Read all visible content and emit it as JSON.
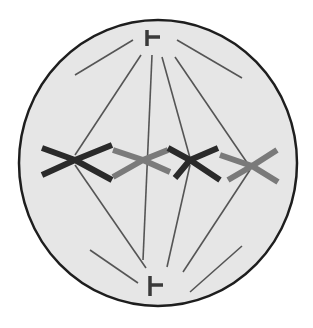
{
  "diagram": {
    "colors": {
      "background": "#ffffff",
      "cytoplasm": "#e6e6e6",
      "membrane": "#1e1e1e",
      "fiber": "#555555",
      "centriole": "#3a3a3a",
      "chromosome_dark": "#2a2a2a",
      "chromosome_light": "#7a7a7a"
    },
    "cell": {
      "cx": 158,
      "cy": 163,
      "rx": 139,
      "ry": 143
    },
    "centrioles": [
      {
        "name": "top",
        "x": 147,
        "y1": 30,
        "y2": 46,
        "nub_y": 37,
        "nub_x2": 160
      },
      {
        "name": "bottom",
        "x": 150,
        "y1": 276,
        "y2": 296,
        "nub_y": 285,
        "nub_x2": 163
      }
    ],
    "astral_rays": [
      [
        75,
        75,
        133,
        40
      ],
      [
        177,
        40,
        242,
        78
      ],
      [
        90,
        250,
        138,
        283
      ],
      [
        190,
        292,
        242,
        246
      ]
    ],
    "spindle_fibers": [
      [
        141,
        55,
        75,
        155
      ],
      [
        152,
        55,
        143,
        260
      ],
      [
        162,
        57,
        190,
        158
      ],
      [
        175,
        57,
        250,
        167
      ],
      [
        75,
        165,
        146,
        268
      ],
      [
        190,
        165,
        167,
        267
      ],
      [
        250,
        170,
        183,
        272
      ]
    ],
    "chromosomes": [
      {
        "shade": "dark",
        "points": [
          [
            42,
            148
          ],
          [
            75,
            160
          ],
          [
            112,
            145
          ]
        ],
        "points2": [
          [
            42,
            175
          ],
          [
            75,
            160
          ],
          [
            112,
            180
          ]
        ]
      },
      {
        "shade": "light",
        "points": [
          [
            113,
            150
          ],
          [
            143,
            160
          ],
          [
            168,
            150
          ]
        ],
        "points2": [
          [
            113,
            177
          ],
          [
            143,
            160
          ],
          [
            170,
            172
          ]
        ]
      },
      {
        "shade": "dark",
        "points": [
          [
            168,
            148
          ],
          [
            190,
            160
          ],
          [
            218,
            148
          ]
        ],
        "points2": [
          [
            175,
            178
          ],
          [
            190,
            160
          ],
          [
            220,
            180
          ]
        ]
      },
      {
        "shade": "light",
        "points": [
          [
            220,
            155
          ],
          [
            252,
            166
          ],
          [
            277,
            150
          ]
        ],
        "points2": [
          [
            228,
            180
          ],
          [
            252,
            166
          ],
          [
            278,
            182
          ]
        ]
      }
    ]
  }
}
